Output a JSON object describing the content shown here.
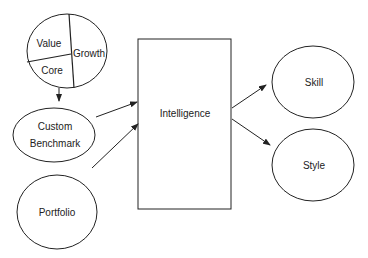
{
  "diagram": {
    "style_pie": {
      "segments": [
        "Value",
        "Growth",
        "Core"
      ]
    },
    "nodes": {
      "custom_benchmark": {
        "line1": "Custom",
        "line2": "Benchmark"
      },
      "portfolio": "Portfolio",
      "intelligence": "Intelligence",
      "skill": "Skill",
      "style": "Style"
    },
    "edges": [
      {
        "from": "style_pie",
        "to": "custom_benchmark"
      },
      {
        "from": "custom_benchmark",
        "to": "intelligence"
      },
      {
        "from": "portfolio",
        "to": "intelligence"
      },
      {
        "from": "intelligence",
        "to": "skill"
      },
      {
        "from": "intelligence",
        "to": "style"
      }
    ],
    "colors": {
      "stroke": "#222222",
      "background": "#ffffff"
    }
  }
}
